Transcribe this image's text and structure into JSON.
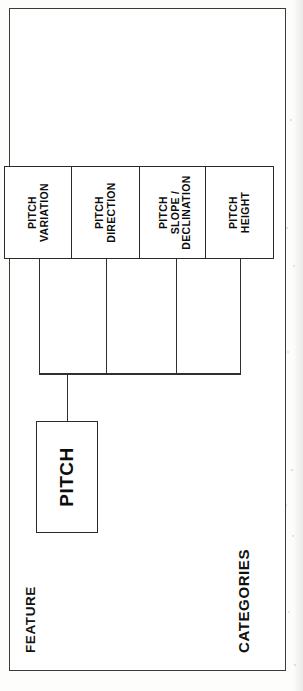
{
  "figure": {
    "type": "hierarchy-tree",
    "orientation": "rotated-90-ccw",
    "column_headings": {
      "feature": "FEATURE",
      "categories": "CATEGORIES"
    },
    "root": {
      "id": "pitch",
      "label": "PITCH"
    },
    "categories": [
      {
        "id": "pitch-height",
        "label": "PITCH\nHEIGHT",
        "line1": "PITCH",
        "line2": "HEIGHT",
        "line3": ""
      },
      {
        "id": "pitch-slope-declination",
        "label": "PITCH\nSLOPE /\nDECLINATION",
        "line1": "PITCH",
        "line2": "SLOPE /",
        "line3": "DECLINATION"
      },
      {
        "id": "pitch-direction",
        "label": "PITCH\nDIRECTION",
        "line1": "PITCH",
        "line2": "DIRECTION",
        "line3": ""
      },
      {
        "id": "pitch-variation",
        "label": "PITCH\nVARIATION",
        "line1": "PITCH",
        "line2": "VARIATION",
        "line3": ""
      }
    ],
    "colors": {
      "page_background": "#fdfdfc",
      "frame_stroke": "#3a3a3a",
      "node_stroke": "#2a2a2a",
      "connector_stroke": "#2f2f2f",
      "text": "#0d0d0d"
    }
  }
}
